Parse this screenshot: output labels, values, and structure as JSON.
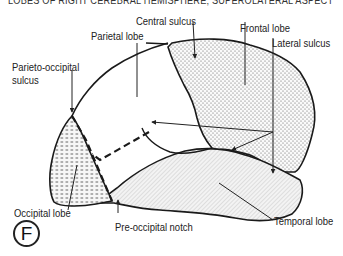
{
  "title": "LOBES OF RIGHT CEREBRAL HEMISPHERE; SUPEROLATERAL ASPECT",
  "badge": "F",
  "labels": {
    "central_sulcus": "Central sulcus",
    "frontal_lobe": "Frontal lobe",
    "parietal_lobe": "Parietal lobe",
    "lateral_sulcus": "Lateral sulcus",
    "parieto_occipital_line1": "Parieto-occipital",
    "parieto_occipital_line2": "sulcus",
    "occipital_lobe": "Occipital lobe",
    "pre_occipital_notch": "Pre-occipital notch",
    "temporal_lobe": "Temporal lobe"
  },
  "colors": {
    "outline": "#1a1a1a",
    "frontal_fill": "#f2f2f2",
    "temporal_fill": "#ececec",
    "occipital_fill": "#e6e6e6"
  }
}
